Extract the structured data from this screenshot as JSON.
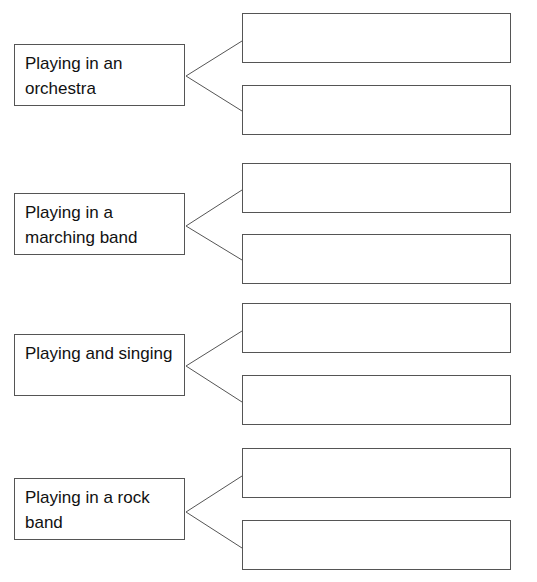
{
  "worksheet": {
    "groups": [
      {
        "label": "Playing in an orchestra",
        "answers": [
          "",
          ""
        ]
      },
      {
        "label": "Playing in a marching band",
        "answers": [
          "",
          ""
        ]
      },
      {
        "label": "Playing and singing",
        "answers": [
          "",
          ""
        ]
      },
      {
        "label": "Playing in a rock band",
        "answers": [
          "",
          ""
        ]
      }
    ]
  }
}
